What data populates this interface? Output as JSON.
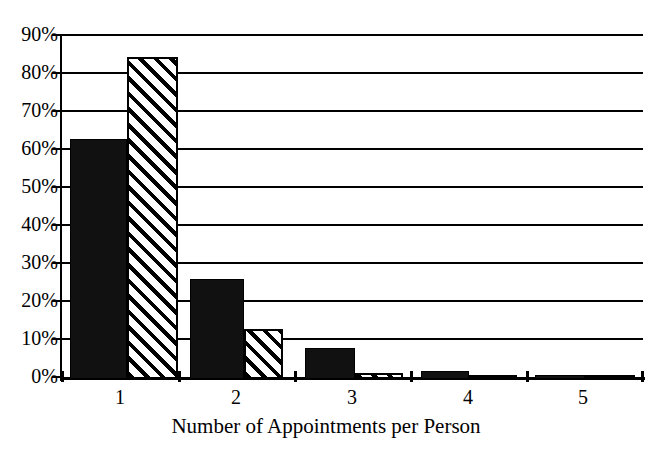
{
  "chart_data": {
    "type": "bar",
    "title": "",
    "xlabel": "Number of Appointments per Person",
    "ylabel": "",
    "categories": [
      "1",
      "2",
      "3",
      "4",
      "5"
    ],
    "series": [
      {
        "name": "Series 1 (solid black)",
        "pattern": "solid",
        "color": "#111111",
        "values": [
          62.5,
          26,
          8,
          2,
          1
        ]
      },
      {
        "name": "Series 2 (diagonal hatch)",
        "pattern": "diagonal-hatch",
        "color": "#ffffff",
        "values": [
          84,
          13,
          1.5,
          0.3,
          0.2
        ]
      }
    ],
    "ylim": [
      0,
      90
    ],
    "yticks": [
      0,
      10,
      20,
      30,
      40,
      50,
      60,
      70,
      80,
      90
    ],
    "ytick_labels": [
      "0%",
      "10%",
      "20%",
      "30%",
      "40%",
      "50%",
      "60%",
      "70%",
      "80%",
      "90%"
    ],
    "grid": "horizontal",
    "legend": "none",
    "units": "percent"
  },
  "axis": {
    "x_title": "Number of Appointments per Person"
  }
}
